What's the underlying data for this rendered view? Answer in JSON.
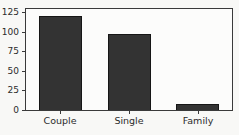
{
  "chart_data": {
    "type": "bar",
    "title": "",
    "xlabel": "",
    "ylabel": "",
    "categories": [
      "Couple",
      "Single",
      "Family"
    ],
    "values": [
      120,
      97,
      8
    ],
    "yticks": [
      0,
      25,
      50,
      75,
      100,
      125
    ],
    "ylim": [
      0,
      129
    ],
    "bar_width_frac": 0.62,
    "grid": false,
    "colors": {
      "bar_fill": "#333333",
      "bar_edge": "#161616",
      "spine": "#3a3a3a",
      "tick_text": "#2b2b2b",
      "background": "#f8f8f6",
      "plot_background": "#fcfcfb"
    }
  }
}
